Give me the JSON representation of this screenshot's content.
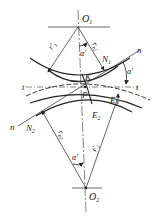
{
  "diagram": {
    "type": "gear-meshing-geometry",
    "colors": {
      "line": "#222222",
      "background": "#ffffff"
    },
    "labels": {
      "O1": "O",
      "O1_sub": "1",
      "O2": "O",
      "O2_sub": "2",
      "P": "P",
      "K": "K",
      "N1": "N",
      "N1_sub": "1",
      "N2": "N",
      "N2_sub": "2",
      "E1": "E",
      "E1_sub": "1",
      "E2": "E",
      "E2_sub": "2",
      "t_left": "t",
      "t_right": "t",
      "n_top": "n",
      "n_bottom": "n",
      "alpha_top": "α'",
      "alpha_right": "α'",
      "alpha_bottom": "α'",
      "r1_prime": "r'",
      "r1_prime_sub": "1",
      "rb1": "r",
      "rb1_sub": "b1",
      "rb2": "r",
      "rb2_sub": "b2",
      "r2_prime": "r'",
      "r2_prime_sub": "2"
    }
  }
}
